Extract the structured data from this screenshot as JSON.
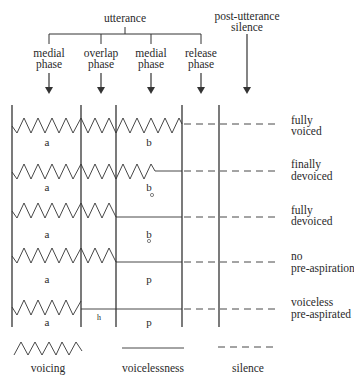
{
  "header": {
    "utterance": "utterance",
    "post_utterance": [
      "post-utterance",
      "silence"
    ]
  },
  "phases": [
    {
      "line1": "medial",
      "line2": "phase"
    },
    {
      "line1": "overlap",
      "line2": "phase"
    },
    {
      "line1": "medial",
      "line2": "phase"
    },
    {
      "line1": "release",
      "line2": "phase"
    }
  ],
  "rows": [
    {
      "vowel": "a",
      "consonant": "b",
      "devoiced_ring": false,
      "aspiration": "",
      "label": [
        "fully",
        "voiced"
      ]
    },
    {
      "vowel": "a",
      "consonant": "b",
      "devoiced_ring": true,
      "aspiration": "",
      "label": [
        "finally",
        "devoiced"
      ]
    },
    {
      "vowel": "a",
      "consonant": "b",
      "devoiced_ring": true,
      "aspiration": "",
      "label": [
        "fully",
        "devoiced"
      ]
    },
    {
      "vowel": "a",
      "consonant": "p",
      "devoiced_ring": false,
      "aspiration": "",
      "label": [
        "no",
        "pre-aspiration"
      ]
    },
    {
      "vowel": "a",
      "consonant": "p",
      "devoiced_ring": false,
      "aspiration": "h",
      "label": [
        "voiceless",
        "pre-aspirated"
      ]
    }
  ],
  "legend": {
    "voicing": "voicing",
    "voicelessness": "voicelessness",
    "silence": "silence"
  },
  "ring_symbol": "̊"
}
